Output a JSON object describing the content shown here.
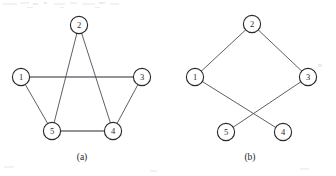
{
  "figure": {
    "background_color": "#ffffff",
    "node_stroke_color": "#2a2a2e",
    "edge_color": "#4e4e52",
    "edge_highlight_color": "#70707a",
    "label_color": "#29292d",
    "node_radius": 8.6,
    "graphs": [
      {
        "id": "graph-a",
        "caption": "(a)",
        "caption_x": 82,
        "caption_y": 160,
        "nodes": [
          {
            "label": "1",
            "x": 21,
            "y": 77
          },
          {
            "label": "2",
            "x": 79,
            "y": 25
          },
          {
            "label": "3",
            "x": 142,
            "y": 77
          },
          {
            "label": "4",
            "x": 113,
            "y": 131
          },
          {
            "label": "5",
            "x": 52,
            "y": 131
          }
        ],
        "edges": [
          {
            "from": "1",
            "to": "3",
            "weight": "thick"
          },
          {
            "from": "1",
            "to": "5",
            "weight": "thin"
          },
          {
            "from": "2",
            "to": "5",
            "weight": "thin"
          },
          {
            "from": "2",
            "to": "4",
            "weight": "thin"
          },
          {
            "from": "3",
            "to": "4",
            "weight": "thin"
          },
          {
            "from": "5",
            "to": "4",
            "weight": "thick"
          }
        ]
      },
      {
        "id": "graph-b",
        "caption": "(b)",
        "caption_x": 250,
        "caption_y": 160,
        "nodes": [
          {
            "label": "1",
            "x": 195,
            "y": 77
          },
          {
            "label": "2",
            "x": 252,
            "y": 24
          },
          {
            "label": "3",
            "x": 308,
            "y": 77
          },
          {
            "label": "4",
            "x": 283,
            "y": 132
          },
          {
            "label": "5",
            "x": 226,
            "y": 132
          }
        ],
        "edges": [
          {
            "from": "1",
            "to": "2",
            "weight": "thin"
          },
          {
            "from": "2",
            "to": "3",
            "weight": "thin"
          },
          {
            "from": "1",
            "to": "4",
            "weight": "thin"
          },
          {
            "from": "3",
            "to": "5",
            "weight": "thin"
          }
        ]
      }
    ],
    "scan_artifacts": [
      {
        "x": 3,
        "y": 3,
        "w": 14,
        "h": 2
      },
      {
        "x": 20,
        "y": 2,
        "w": 9,
        "h": 2
      },
      {
        "x": 33,
        "y": 3,
        "w": 5,
        "h": 2
      },
      {
        "x": 44,
        "y": 2,
        "w": 3,
        "h": 2
      },
      {
        "x": 54,
        "y": 3,
        "w": 11,
        "h": 2
      },
      {
        "x": 70,
        "y": 2,
        "w": 7,
        "h": 2
      },
      {
        "x": 82,
        "y": 3,
        "w": 13,
        "h": 2
      },
      {
        "x": 99,
        "y": 2,
        "w": 6,
        "h": 2
      },
      {
        "x": 110,
        "y": 3,
        "w": 9,
        "h": 2
      },
      {
        "x": 27,
        "y": 7,
        "w": 6,
        "h": 1
      },
      {
        "x": 60,
        "y": 7,
        "w": 4,
        "h": 1
      },
      {
        "x": 95,
        "y": 7,
        "w": 5,
        "h": 1
      },
      {
        "x": 318,
        "y": 64,
        "w": 4,
        "h": 3
      },
      {
        "x": 4,
        "y": 166,
        "w": 10,
        "h": 2
      },
      {
        "x": 150,
        "y": 170,
        "w": 7,
        "h": 2
      },
      {
        "x": 300,
        "y": 168,
        "w": 9,
        "h": 2
      }
    ]
  }
}
